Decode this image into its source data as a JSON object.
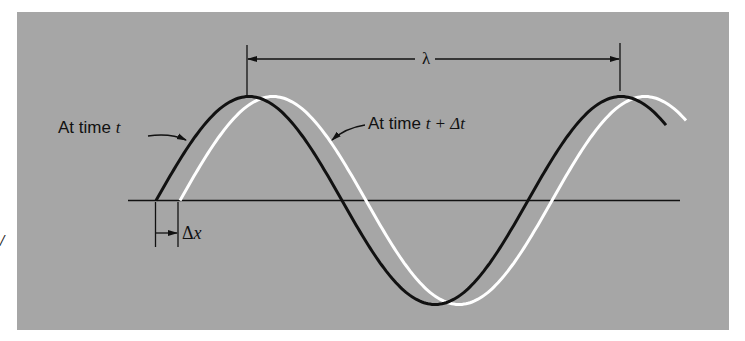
{
  "figure": {
    "background_color": "#a6a6a6",
    "page_color": "#ffffff",
    "curves": [
      {
        "name": "wave-at-time-t",
        "color": "#111111",
        "label_prefix": "At time",
        "label_var": "t"
      },
      {
        "name": "wave-at-time-t-plus-dt",
        "color": "#ffffff",
        "label_prefix": "At time",
        "label_var": "t + Δt"
      }
    ],
    "wavelength_symbol": "λ",
    "shift_prefix": "Δ",
    "shift_var": "x",
    "stray_mark": "/"
  }
}
